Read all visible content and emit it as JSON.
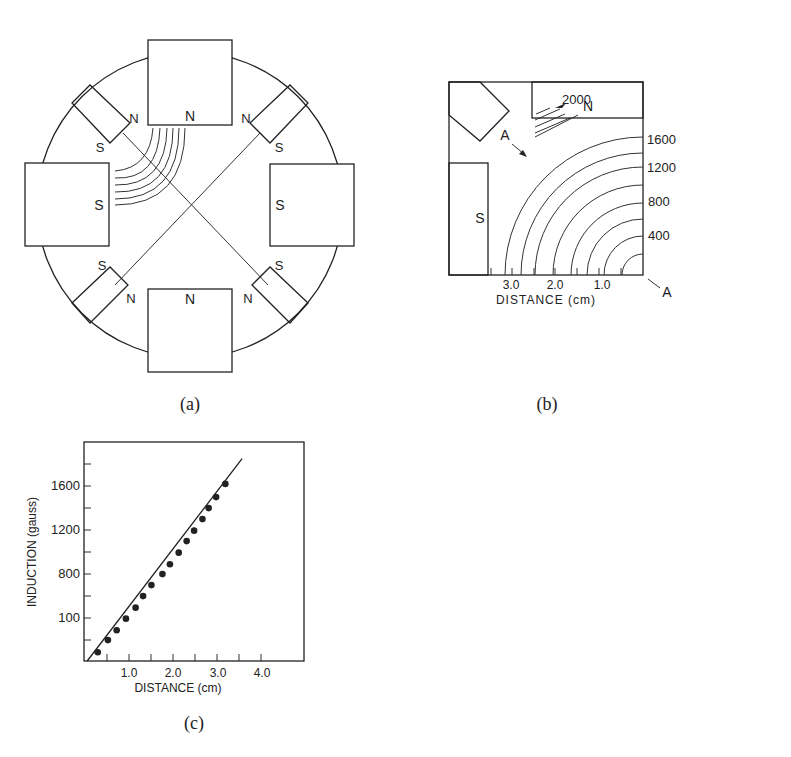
{
  "figure_a": {
    "caption": "(a)",
    "poles": {
      "top_main": "N",
      "bottom_main": "N",
      "left_main": "S",
      "right_main": "S",
      "top_left_small": [
        "N",
        "S"
      ],
      "top_right_small": [
        "N",
        "S"
      ],
      "bottom_left_small": [
        "S",
        "N"
      ],
      "bottom_right_small": [
        "S",
        "N"
      ]
    }
  },
  "figure_b": {
    "caption": "(b)",
    "pole_top": "N",
    "pole_left": "S",
    "arrow_label": "A",
    "corner_label": "A",
    "contour_top_label": "2000",
    "contour_labels": [
      "1600",
      "1200",
      "800",
      "400"
    ],
    "x_tick_labels": [
      "3.0",
      "2.0",
      "1.0"
    ],
    "xlabel": "DISTANCE (cm)"
  },
  "figure_c": {
    "caption": "(c)",
    "ylabel": "INDUCTION (gauss)",
    "xlabel": "DISTANCE (cm)",
    "y_tick_labels": [
      "1600",
      "1200",
      "800",
      "100"
    ],
    "x_tick_labels": [
      "1.0",
      "2.0",
      "3.0",
      "4.0"
    ]
  },
  "chart_data": {
    "type": "scatter",
    "title": "",
    "xlabel": "DISTANCE (cm)",
    "ylabel": "INDUCTION (gauss)",
    "xlim": [
      0,
      5.0
    ],
    "ylim": [
      0,
      2000
    ],
    "x_ticks": [
      1.0,
      2.0,
      3.0,
      4.0
    ],
    "y_ticks": [
      400,
      800,
      1200,
      1600
    ],
    "grid": false,
    "series": [
      {
        "name": "measured",
        "x": [
          0.29,
          0.52,
          0.72,
          0.93,
          1.15,
          1.32,
          1.51,
          1.76,
          1.93,
          2.13,
          2.31,
          2.48,
          2.67,
          2.81,
          2.98,
          3.19
        ],
        "y": [
          80,
          190,
          280,
          385,
          485,
          590,
          690,
          790,
          880,
          985,
          1090,
          1185,
          1290,
          1390,
          1490,
          1610
        ]
      },
      {
        "name": "linear fit",
        "x": [
          0.05,
          3.57
        ],
        "y": [
          0,
          1840
        ]
      }
    ]
  }
}
